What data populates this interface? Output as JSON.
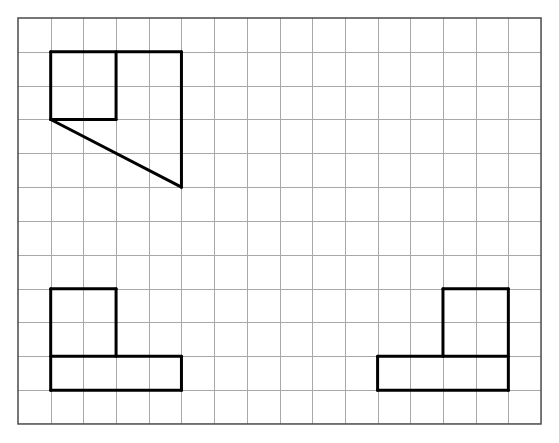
{
  "diagram": {
    "type": "grid-drawing",
    "grid": {
      "columns": 16,
      "rows": 12,
      "origin_px": [
        18,
        18
      ],
      "cell_width_px": 32.69,
      "cell_height_px": 33.83,
      "line_color": "#a8a8a8",
      "border_color": "#4a4a4a"
    },
    "shape_color": "#000000",
    "shapes": [
      {
        "name": "top-left-view",
        "description": "Square of 2x2 cells inside a 4-wide outline with a diagonal edge forming a trapezoid below",
        "segments": [
          [
            [
              1,
              1
            ],
            [
              5,
              1
            ]
          ],
          [
            [
              1,
              1
            ],
            [
              1,
              3
            ]
          ],
          [
            [
              3,
              1
            ],
            [
              3,
              3
            ]
          ],
          [
            [
              1,
              3
            ],
            [
              3,
              3
            ]
          ],
          [
            [
              5,
              1
            ],
            [
              5,
              5
            ]
          ],
          [
            [
              1,
              3
            ],
            [
              5,
              5
            ]
          ]
        ]
      },
      {
        "name": "bottom-left-view",
        "description": "L-shape: 2x2 square on top-left of a 4x1 bar",
        "segments": [
          [
            [
              1,
              8
            ],
            [
              3,
              8
            ]
          ],
          [
            [
              1,
              8
            ],
            [
              1,
              11
            ]
          ],
          [
            [
              3,
              8
            ],
            [
              3,
              10
            ]
          ],
          [
            [
              1,
              10
            ],
            [
              5,
              10
            ]
          ],
          [
            [
              5,
              10
            ],
            [
              5,
              11
            ]
          ],
          [
            [
              1,
              11
            ],
            [
              5,
              11
            ]
          ]
        ]
      },
      {
        "name": "bottom-right-view",
        "description": "L-shape: 2x2 square on top-right of a 4x1 bar",
        "segments": [
          [
            [
              13,
              8
            ],
            [
              15,
              8
            ]
          ],
          [
            [
              13,
              8
            ],
            [
              13,
              10
            ]
          ],
          [
            [
              15,
              8
            ],
            [
              15,
              11
            ]
          ],
          [
            [
              11,
              10
            ],
            [
              15,
              10
            ]
          ],
          [
            [
              11,
              10
            ],
            [
              11,
              11
            ]
          ],
          [
            [
              11,
              11
            ],
            [
              15,
              11
            ]
          ]
        ]
      }
    ]
  }
}
